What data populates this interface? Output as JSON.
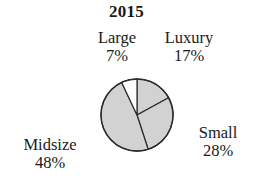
{
  "chart_data": {
    "type": "pie",
    "title": "2015",
    "xlabel": "",
    "ylabel": "",
    "legend_position": "none",
    "grid": false,
    "labels_outside": true,
    "start_angle_deg": 0,
    "direction": "clockwise",
    "categories": [
      "Luxury",
      "Small",
      "Midsize",
      "Large"
    ],
    "values": [
      17,
      28,
      48,
      7
    ],
    "unit": "%",
    "slices": [
      {
        "name": "Luxury",
        "value": 17,
        "value_label": "17%",
        "fill": "#d2d2d2",
        "start_deg": 0,
        "end_deg": 61.2
      },
      {
        "name": "Small",
        "value": 28,
        "value_label": "28%",
        "fill": "#d2d2d2",
        "start_deg": 61.2,
        "end_deg": 162.0
      },
      {
        "name": "Midsize",
        "value": 48,
        "value_label": "48%",
        "fill": "#d2d2d2",
        "start_deg": 162.0,
        "end_deg": 334.8
      },
      {
        "name": "Large",
        "value": 7,
        "value_label": "7%",
        "fill": "#ffffff",
        "start_deg": 334.8,
        "end_deg": 360.0
      }
    ],
    "colors": {
      "background": "#ffffff",
      "slice_gray": "#d2d2d2",
      "slice_white": "#ffffff",
      "outline": "#2b2b2b",
      "text": "#1a1a1a"
    }
  },
  "labels": {
    "large": {
      "name": "Large",
      "value": "7%"
    },
    "luxury": {
      "name": "Luxury",
      "value": "17%"
    },
    "small": {
      "name": "Small",
      "value": "28%"
    },
    "midsize": {
      "name": "Midsize",
      "value": "48%"
    }
  }
}
